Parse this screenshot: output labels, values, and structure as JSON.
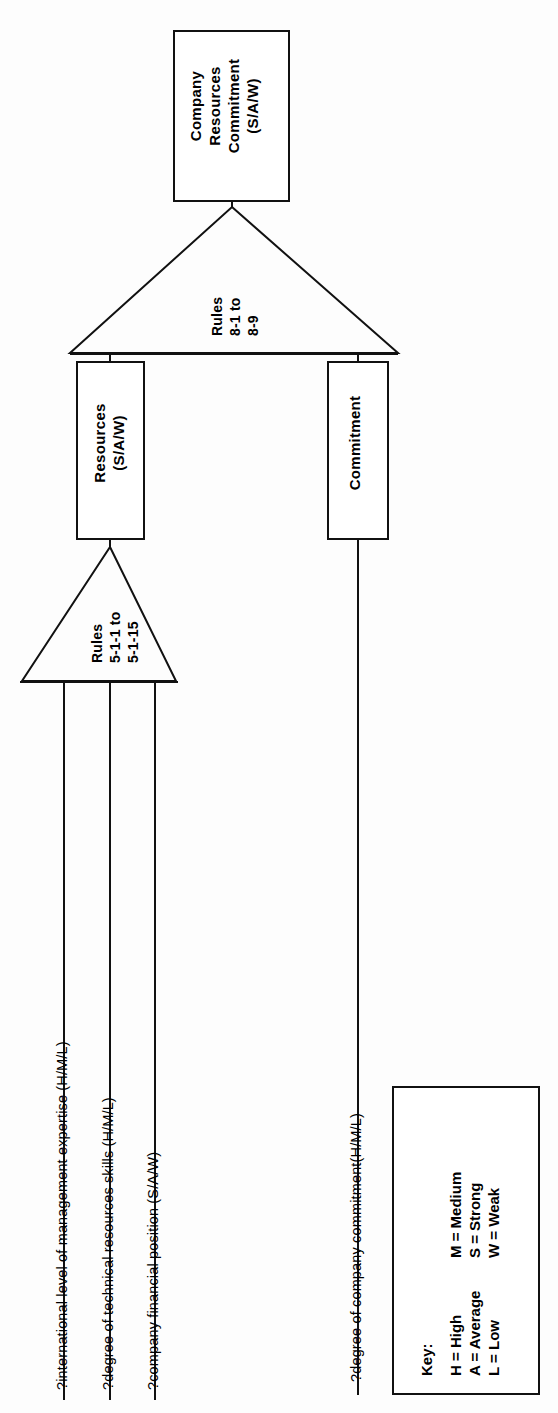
{
  "diagram": {
    "orientation": "rotated-90-ccw",
    "nodes": {
      "root": {
        "label": "Company\nResources\nCommitment\n(S/A/W)"
      },
      "resources": {
        "label": "Resources\n(S/A/W)"
      },
      "commitment": {
        "label": "Commitment"
      }
    },
    "rule_nodes": {
      "upper": {
        "label": "Rules\n8-1 to\n8-9"
      },
      "lower": {
        "label": "Rules\n5-1-1 to\n5-1-15"
      }
    },
    "questions": [
      {
        "text": "?international level of management expertise  (H/M/L)"
      },
      {
        "text": "?degree of technical resources skills  (H/M/L)"
      },
      {
        "text": "?company financial position (S/A/W)"
      },
      {
        "text": "?degree of company commitment(H/M/L)"
      }
    ],
    "key": {
      "title": "Key:",
      "left_column": [
        "H = High",
        "A = Average",
        "L = Low"
      ],
      "right_column": [
        "M = Medium",
        "S = Strong",
        "W = Weak"
      ]
    },
    "colors": {
      "stroke": "#111111",
      "background": "#ffffff",
      "text": "#000000"
    }
  }
}
